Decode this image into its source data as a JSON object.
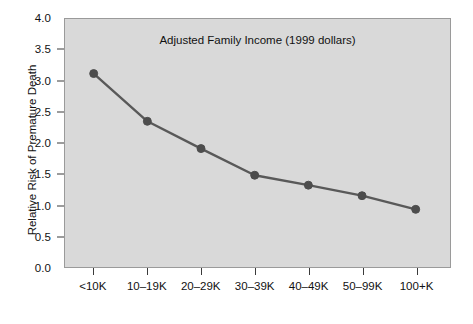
{
  "chart_data": {
    "type": "line",
    "title": "",
    "subtitle": "",
    "xlabel": "Adjusted Family Income (1999 dollars)",
    "ylabel": "Relative Risk of Premature Death",
    "categories": [
      "<10K",
      "10–19K",
      "20–29K",
      "30–39K",
      "40–49K",
      "50–99K",
      "100+K"
    ],
    "values": [
      3.12,
      2.35,
      1.91,
      1.48,
      1.32,
      1.15,
      0.93
    ],
    "series": [
      {
        "name": "Relative Risk of Premature Death",
        "values": [
          3.12,
          2.35,
          1.91,
          1.48,
          1.32,
          1.15,
          0.93
        ]
      }
    ],
    "ylim": [
      0.0,
      4.0
    ],
    "ytick_step": 0.5,
    "ytick_labels": [
      "0.0",
      "0.5",
      "1.0",
      "1.5",
      "2.0",
      "2.5",
      "3.0",
      "3.5",
      "4.0"
    ],
    "ytick_values": [
      0.0,
      0.5,
      1.0,
      1.5,
      2.0,
      2.5,
      3.0,
      3.5,
      4.0
    ],
    "grid": false,
    "legend": "none",
    "marker": "circle",
    "colors": {
      "line": "#595959",
      "marker": "#4d4d4d",
      "plot_background": "#d9d9d9",
      "figure_background": "#ffffff",
      "axis": "#3a3a3a",
      "text": "#111111"
    }
  }
}
